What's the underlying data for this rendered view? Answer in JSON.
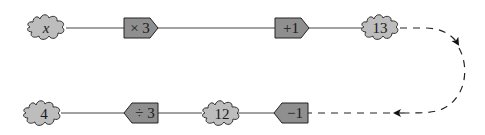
{
  "diagram": {
    "type": "function-machine-flow",
    "top_row": {
      "input": "x",
      "operations": [
        "× 3",
        "+ 1"
      ],
      "output": "13"
    },
    "bottom_row": {
      "input": "12",
      "operations": [
        "− 1",
        "÷ 3"
      ],
      "output": "4"
    },
    "loop_connector": "13 → − 1 (dashed)",
    "colors": {
      "cloud_fill": "#bdbdbd",
      "box_fill": "#8f8f8f",
      "stroke": "#222222"
    }
  },
  "nodes": {
    "x": "x",
    "times3": "× 3",
    "plus1": "+1",
    "n13": "13",
    "minus1": "−1",
    "n12": "12",
    "div3": "÷ 3",
    "n4": "4"
  }
}
